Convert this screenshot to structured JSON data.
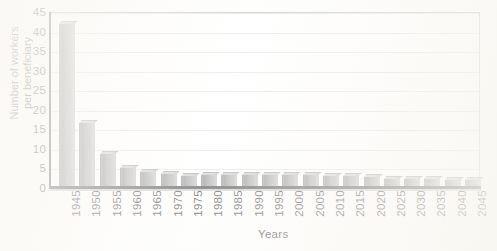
{
  "chart_data": {
    "type": "bar",
    "title": "",
    "xlabel": "Years",
    "ylabel": "Number of workers per beneficiary",
    "ylabel_line1": "Number of workers",
    "ylabel_line2": "per beneficiary",
    "ylim": [
      0,
      45
    ],
    "yticks": [
      0,
      5,
      10,
      15,
      20,
      25,
      30,
      35,
      40,
      45
    ],
    "grid": true,
    "legend": "none",
    "bar_color": "#9a9a9a",
    "categories": [
      "1945",
      "1950",
      "1955",
      "1960",
      "1965",
      "1970",
      "1975",
      "1980",
      "1985",
      "1990",
      "1995",
      "2000",
      "2005",
      "2010",
      "2015",
      "2020",
      "2025",
      "2030",
      "2035",
      "2040",
      "2045"
    ],
    "values": [
      42.0,
      16.5,
      8.6,
      5.1,
      4.0,
      3.7,
      3.2,
      3.3,
      3.3,
      3.3,
      3.3,
      3.4,
      3.3,
      3.2,
      3.0,
      2.7,
      2.4,
      2.3,
      2.2,
      2.1,
      2.0
    ]
  }
}
